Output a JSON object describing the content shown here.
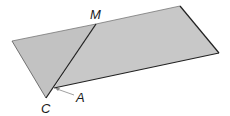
{
  "diagram": {
    "type": "folded-parallelogram",
    "fill_color": "#c8c8c8",
    "stroke_color": "#222222",
    "labels": {
      "M": "M",
      "A": "A",
      "C": "C"
    }
  }
}
